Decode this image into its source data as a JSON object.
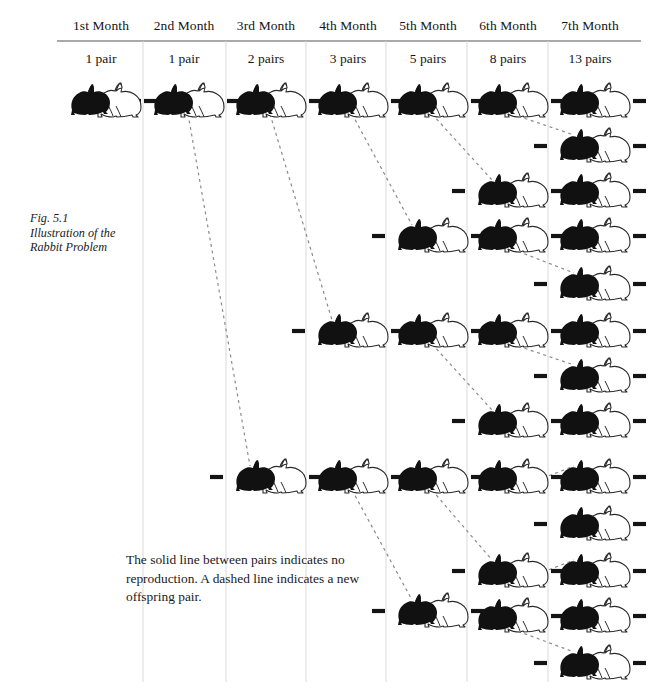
{
  "figure": {
    "caption_lines": [
      "Fig. 5.1",
      "Illustration of the",
      "Rabbit Problem"
    ],
    "legend_note": "The solid line between pairs indicates no reproduction. A dashed line indicates a new offspring pair.",
    "footer": ""
  },
  "columns": [
    {
      "month": "1st Month",
      "pairs": "1 pair",
      "count": 1,
      "x": 101
    },
    {
      "month": "2nd Month",
      "pairs": "1 pair",
      "count": 1,
      "x": 184
    },
    {
      "month": "3rd Month",
      "pairs": "2 pairs",
      "count": 2,
      "x": 266
    },
    {
      "month": "4th Month",
      "pairs": "3 pairs",
      "count": 3,
      "x": 348
    },
    {
      "month": "5th Month",
      "pairs": "5 pairs",
      "count": 5,
      "x": 428
    },
    {
      "month": "6th Month",
      "pairs": "8 pairs",
      "count": 8,
      "x": 508
    },
    {
      "month": "7th Month",
      "pairs": "13 pairs",
      "count": 13,
      "x": 590
    }
  ],
  "chart_data": {
    "type": "diagram",
    "title": "Illustration of the Rabbit Problem",
    "sequence_name": "Fibonacci rabbit breeding",
    "categories": [
      "1st Month",
      "2nd Month",
      "3rd Month",
      "4th Month",
      "5th Month",
      "6th Month",
      "7th Month"
    ],
    "values": [
      1,
      1,
      2,
      3,
      5,
      8,
      13
    ],
    "value_labels": [
      "1 pair",
      "1 pair",
      "2 pairs",
      "3 pairs",
      "5 pairs",
      "8 pairs",
      "13 pairs"
    ],
    "xlabel": "Month",
    "ylabel": "Number of rabbit pairs",
    "legend": [
      {
        "key": "solid-line",
        "text": "The solid line between pairs indicates no reproduction."
      },
      {
        "key": "dashed-line",
        "text": "A dashed line indicates a new offspring pair."
      }
    ],
    "rabbit_rows": {
      "col1": [
        100
      ],
      "col2": [
        100
      ],
      "col3": [
        100,
        476
      ],
      "col4": [
        100,
        330,
        476
      ],
      "col5": [
        100,
        235,
        330,
        476,
        610
      ],
      "col6": [
        100,
        190,
        235,
        330,
        420,
        476,
        570,
        615
      ],
      "col7": [
        100,
        145,
        190,
        235,
        283,
        330,
        375,
        420,
        476,
        523,
        570,
        615,
        662
      ]
    }
  },
  "grid": {
    "rule_y": 41,
    "rule_left": 57,
    "rule_right": 641,
    "divider_xs": [
      143,
      226,
      306,
      386,
      467,
      548
    ],
    "divider_top": 41,
    "divider_bottom": 682,
    "rule_color": "#555555",
    "divider_color": "#d9d9d9"
  },
  "colors": {
    "ink": "#1a1a1a",
    "rabbit_dark": "#111111",
    "rabbit_light_stroke": "#2a2a2a",
    "connector": "#141414",
    "dashed": "#8a8a8a",
    "background": "#ffffff"
  }
}
